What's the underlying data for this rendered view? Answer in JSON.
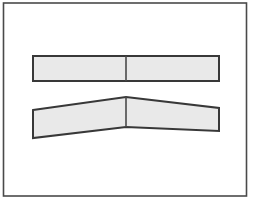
{
  "figure": {
    "title": "",
    "canvas": {
      "width": 258,
      "height": 204
    },
    "background_color": "#ffffff",
    "frame": {
      "name": "outer-border",
      "x": 3.5,
      "y": 3.0,
      "width": 243.0,
      "height": 193.0,
      "stroke_color": "#4a4a4a",
      "stroke_width": 1.6,
      "fill_color": "#ffffff"
    },
    "style": {
      "shape_fill": "#e9e9e9",
      "shape_stroke": "#383838",
      "shape_stroke_width": 2.0,
      "divider_stroke": "#4a4a4a",
      "divider_stroke_width": 1.6
    },
    "shapes": [
      {
        "name": "straight-bar",
        "label": "undeformed straight bar",
        "type": "polygon",
        "points": "33,56 219,56 219,81 33,81",
        "fill": "#e9e9e9",
        "stroke": "#383838",
        "divider": {
          "name": "bar-midline",
          "x1": 126,
          "y1": 56,
          "x2": 126,
          "y2": 81
        }
      },
      {
        "name": "bent-bar",
        "label": "deformed bent bar",
        "type": "polygon",
        "points": "33,110 126,97 219,108 219,131 126,127 33,138",
        "fill": "#e9e9e9",
        "stroke": "#383838",
        "divider": {
          "name": "bend-axis",
          "x1": 126,
          "y1": 97,
          "x2": 126,
          "y2": 127
        }
      }
    ],
    "annotations": []
  }
}
